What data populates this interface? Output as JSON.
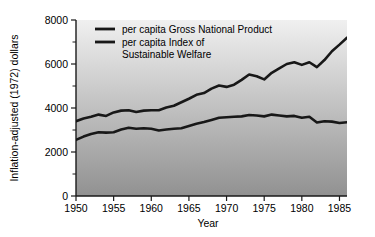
{
  "chart_data": {
    "type": "line",
    "title": "",
    "xlabel": "Year",
    "ylabel": "Inflation-adjusted (1972) dollars",
    "xlim": [
      1950,
      1986
    ],
    "ylim": [
      0,
      8000
    ],
    "grid": false,
    "legend_position": "top-left-inside",
    "x_ticklabels": [
      "1950",
      "1955",
      "1960",
      "1965",
      "1970",
      "1975",
      "1980",
      "1985"
    ],
    "x_tickvalues": [
      1950,
      1955,
      1960,
      1965,
      1970,
      1975,
      1980,
      1985
    ],
    "y_ticklabels": [
      "0",
      "2000",
      "4000",
      "6000",
      "8000"
    ],
    "y_tickvalues": [
      0,
      2000,
      4000,
      6000,
      8000
    ],
    "y_minor_tickvalues": [
      1000,
      3000,
      5000,
      7000
    ],
    "x": [
      1950,
      1951,
      1952,
      1953,
      1954,
      1955,
      1956,
      1957,
      1958,
      1959,
      1960,
      1961,
      1962,
      1963,
      1964,
      1965,
      1966,
      1967,
      1968,
      1969,
      1970,
      1971,
      1972,
      1973,
      1974,
      1975,
      1976,
      1977,
      1978,
      1979,
      1980,
      1981,
      1982,
      1983,
      1984,
      1985,
      1986
    ],
    "series": [
      {
        "name": "per capita Gross National Product",
        "color": "#181818",
        "values": [
          3400,
          3520,
          3600,
          3700,
          3640,
          3800,
          3880,
          3900,
          3820,
          3880,
          3900,
          3900,
          4020,
          4100,
          4260,
          4420,
          4600,
          4680,
          4880,
          5020,
          4960,
          5060,
          5280,
          5520,
          5440,
          5300,
          5600,
          5800,
          6000,
          6080,
          5960,
          6080,
          5860,
          6180,
          6580,
          6880,
          7200
        ]
      },
      {
        "name": "per capita Index of Sustainable Welfare",
        "color": "#181818",
        "values": [
          2550,
          2700,
          2820,
          2900,
          2880,
          2900,
          3020,
          3100,
          3060,
          3080,
          3060,
          2980,
          3020,
          3060,
          3080,
          3180,
          3280,
          3360,
          3460,
          3560,
          3580,
          3600,
          3620,
          3680,
          3660,
          3620,
          3700,
          3660,
          3620,
          3640,
          3560,
          3600,
          3340,
          3400,
          3380,
          3320,
          3350
        ]
      }
    ],
    "legend": [
      {
        "label_line1": "per capita Gross National Product",
        "label_line2": ""
      },
      {
        "label_line1": "per capita Index of",
        "label_line2": "Sustainable Welfare"
      }
    ],
    "background": {
      "gradient_top": "#f0f0f0",
      "gradient_bottom": "#919191"
    }
  }
}
